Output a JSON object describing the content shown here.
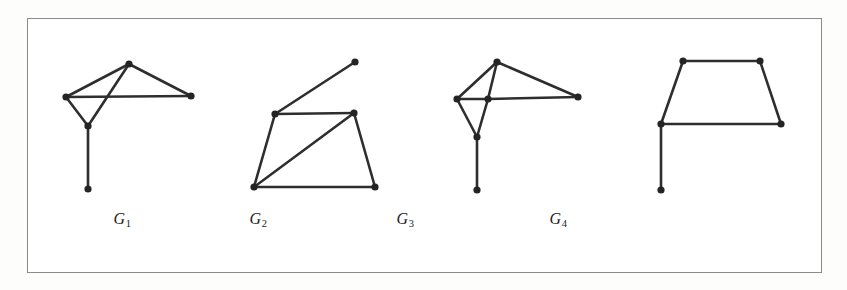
{
  "figure": {
    "background_color": "#fdfdfc",
    "frame_color": "#8a8a8a",
    "edge_color": "#2e2e2e",
    "node_color": "#242424",
    "caption_color": "#1b1b1b"
  },
  "labels": [
    {
      "name": "G1",
      "base": "G",
      "sub": "1",
      "x": 122,
      "y": 210
    },
    {
      "name": "G2",
      "base": "G",
      "sub": "2",
      "x": 258,
      "y": 210
    },
    {
      "name": "G3",
      "base": "G",
      "sub": "3",
      "x": 405,
      "y": 210
    },
    {
      "name": "G4",
      "base": "G",
      "sub": "4",
      "x": 558,
      "y": 210
    }
  ],
  "chart_data": {
    "type": "diagram",
    "title": "",
    "graphs": [
      {
        "id": "G1",
        "label": "G1",
        "vertex_count": 5,
        "edge_count": 6,
        "has_crossing": true,
        "nodes": [
          {
            "id": "a",
            "x": 129,
            "y": 64
          },
          {
            "id": "b",
            "x": 66,
            "y": 97
          },
          {
            "id": "c",
            "x": 191,
            "y": 96
          },
          {
            "id": "d",
            "x": 88,
            "y": 126
          },
          {
            "id": "e",
            "x": 88,
            "y": 189
          }
        ],
        "edges": [
          [
            "a",
            "b"
          ],
          [
            "a",
            "c"
          ],
          [
            "a",
            "d"
          ],
          [
            "b",
            "c"
          ],
          [
            "b",
            "d"
          ],
          [
            "d",
            "e"
          ]
        ]
      },
      {
        "id": "G2",
        "label": "G2",
        "vertex_count": 5,
        "edge_count": 6,
        "has_crossing": false,
        "nodes": [
          {
            "id": "p",
            "x": 355,
            "y": 62
          },
          {
            "id": "q",
            "x": 275,
            "y": 114
          },
          {
            "id": "r",
            "x": 354,
            "y": 113
          },
          {
            "id": "s",
            "x": 254,
            "y": 187
          },
          {
            "id": "t",
            "x": 375,
            "y": 187
          }
        ],
        "edges": [
          [
            "p",
            "q"
          ],
          [
            "q",
            "r"
          ],
          [
            "q",
            "s"
          ],
          [
            "r",
            "s"
          ],
          [
            "r",
            "t"
          ],
          [
            "s",
            "t"
          ]
        ]
      },
      {
        "id": "G3",
        "label": "G3",
        "vertex_count": 6,
        "edge_count": 7,
        "has_crossing": false,
        "nodes": [
          {
            "id": "a",
            "x": 497,
            "y": 62
          },
          {
            "id": "b",
            "x": 457,
            "y": 99
          },
          {
            "id": "m",
            "x": 488,
            "y": 99
          },
          {
            "id": "c",
            "x": 578,
            "y": 97
          },
          {
            "id": "d",
            "x": 477,
            "y": 137
          },
          {
            "id": "e",
            "x": 477,
            "y": 190
          }
        ],
        "edges": [
          [
            "a",
            "b"
          ],
          [
            "a",
            "m"
          ],
          [
            "a",
            "c"
          ],
          [
            "b",
            "m"
          ],
          [
            "m",
            "c"
          ],
          [
            "b",
            "d"
          ],
          [
            "m",
            "d"
          ],
          [
            "d",
            "e"
          ]
        ]
      },
      {
        "id": "G4",
        "label": "G4",
        "vertex_count": 5,
        "edge_count": 5,
        "has_crossing": false,
        "nodes": [
          {
            "id": "tl",
            "x": 683,
            "y": 61
          },
          {
            "id": "tr",
            "x": 760,
            "y": 61
          },
          {
            "id": "bl",
            "x": 661,
            "y": 124
          },
          {
            "id": "br",
            "x": 781,
            "y": 124
          },
          {
            "id": "pd",
            "x": 661,
            "y": 190
          }
        ],
        "edges": [
          [
            "tl",
            "tr"
          ],
          [
            "tl",
            "bl"
          ],
          [
            "tr",
            "br"
          ],
          [
            "bl",
            "br"
          ],
          [
            "bl",
            "pd"
          ]
        ]
      }
    ]
  }
}
